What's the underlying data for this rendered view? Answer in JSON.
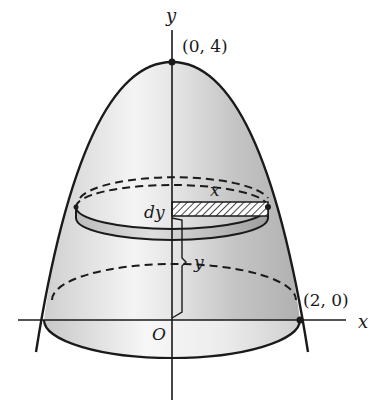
{
  "figure": {
    "axes": {
      "x_label": "x",
      "y_label": "y",
      "origin_label": "O"
    },
    "points": [
      {
        "label": "(0, 4)",
        "x": 0,
        "y": 4
      },
      {
        "label": "(2, 0)",
        "x": 2,
        "y": 0
      }
    ],
    "annotations": {
      "radius_label": "x",
      "thickness_label": "dy",
      "height_label": "y"
    },
    "curve": "y = 4 - x^2",
    "colors": {
      "stroke": "#1a1a1a",
      "shade_light": "#f2f2f2",
      "shade_dark": "#bdbdbd",
      "background": "#ffffff"
    }
  }
}
